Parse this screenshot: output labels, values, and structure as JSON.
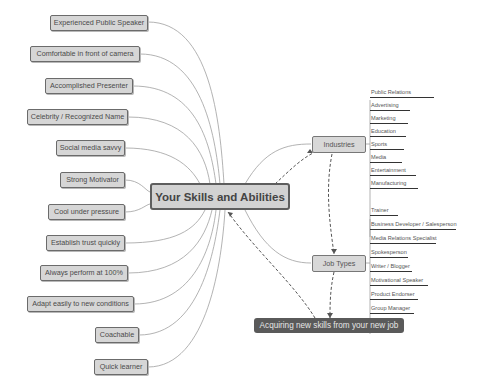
{
  "central_topic": "Your Skills and Abilities",
  "skills": [
    "Experienced Public Speaker",
    "Comfortable in front of camera",
    "Accomplished Presenter",
    "Celebrity / Recognized Name",
    "Social media savvy",
    "Strong Motivator",
    "Cool under pressure",
    "Establish trust quickly",
    "Always perform at 100%",
    "Adapt easily to new conditions",
    "Coachable",
    "Quick learner"
  ],
  "industries": {
    "label": "Industries",
    "items": [
      "Public Relations",
      "Advertising",
      "Marketing",
      "Education",
      "Sports",
      "Media",
      "Entertainment",
      "Manufacturing"
    ]
  },
  "job_types": {
    "label": "Job Types",
    "items": [
      "Trainer",
      "Business Developer / Salesperson",
      "Media Relations Specialist",
      "Spokesperson",
      "Writer / Blogger",
      "Motivational Speaker",
      "Product Endorser",
      "Group Manager"
    ]
  },
  "outcome": "Acquiring new skills from your new job",
  "colors": {
    "node_fill": "#d6d6d6",
    "node_border": "#6b6b6b",
    "line": "#9a9a9a",
    "dashed": "#555555",
    "outcome_fill": "#5a5a5a"
  }
}
